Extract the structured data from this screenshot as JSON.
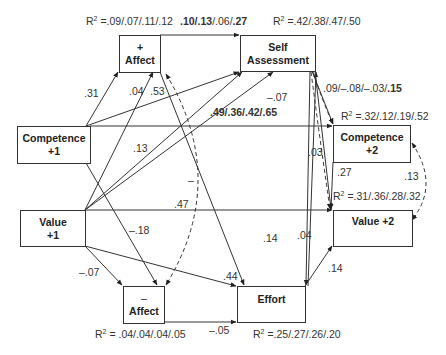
{
  "nodes": {
    "pos_affect": {
      "sign": "+",
      "label": "Affect"
    },
    "self_assessment": {
      "line1": "Self",
      "line2": "Assessment"
    },
    "competence1": {
      "line1": "Competence",
      "line2": "+1"
    },
    "competence2": {
      "line1": "Competence",
      "line2": "+2"
    },
    "value1": {
      "line1": "Value",
      "line2": "+1"
    },
    "value2": {
      "label": "Value +2"
    },
    "neg_affect": {
      "sign": "–",
      "label": "Affect"
    },
    "effort": {
      "label": "Effort"
    }
  },
  "r2": {
    "prefix": "R",
    "sup": "2",
    "pos_affect": " =.09/.07/.11/.12",
    "self_assessment": " =.42/.38/.47/.50",
    "competence2": " =.32/.12/.19/.52",
    "value2": " =.31/.36/.28/.32",
    "neg_affect": " = .04/.04/.04/.05",
    "effort": " =.25/.27/.26/.20"
  },
  "paths": {
    "pos_affect_to_self": {
      "p1": ".10/",
      "p2": ".13",
      "p3": "/.06/",
      "p4": ".27"
    },
    "comp1_to_pos_affect": ".31",
    "value1_to_pos_affect": ".04",
    "pos_affect_to_effort": ".53",
    "comp1_to_self": ".13",
    "value1_to_self": ".49/.36/.42/.65",
    "neg_affect_to_self": "–.07",
    "self_to_comp2": {
      "p1": ".09/–.08/–.03/",
      "p2": ".15"
    },
    "self_to_value2": ".03",
    "comp2_to_value2": ".27",
    "comp2_value2_cov": ".13",
    "value1_to_comp2": ".47",
    "comp1_to_neg_affect": "–.18",
    "pos_neg_affect_cov": "–",
    "value1_to_neg_affect": "–.07",
    "value1_to_effort": ".44",
    "neg_affect_to_effort": "–.05",
    "self_to_effort": ".14",
    "effort_to_self": ".04",
    "effort_to_value2": ".14"
  },
  "colors": {
    "line": "#333333",
    "text": "#222222",
    "background": "#ffffff"
  }
}
